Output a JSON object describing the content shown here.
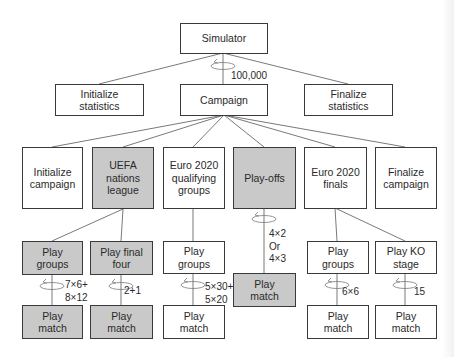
{
  "colors": {
    "border": "#3a3a3a",
    "shaded_fill": "#c9c9c9",
    "plain_fill": "#ffffff",
    "line": "#6a6a6a"
  },
  "tier1": {
    "simulator": "Simulator",
    "loop_label": "100,000"
  },
  "tier2": {
    "initialize_statistics": "Initialize\nstatistics",
    "campaign": "Campaign",
    "finalize_statistics": "Finalize\nstatistics"
  },
  "tier3": {
    "initialize_campaign": "Initialize\ncampaign",
    "uefa_nations_league": "UEFA\nnations\nleague",
    "euro_qualifying_groups": "Euro 2020\nqualifying\ngroups",
    "play_offs": "Play-offs",
    "euro_finals": "Euro 2020\nfinals",
    "finalize_campaign": "Finalize\ncampaign"
  },
  "tier4": {
    "nl_play_groups": "Play\ngroups",
    "nl_play_final_four": "Play final\nfour",
    "q_play_groups": "Play\ngroups",
    "f_play_groups": "Play\ngroups",
    "f_play_ko_stage": "Play KO\nstage"
  },
  "tier5": {
    "nl_groups_match": "Play\nmatch",
    "nl_final_four_match": "Play\nmatch",
    "q_match": "Play\nmatch",
    "playoffs_match": "Play\nmatch",
    "f_groups_match": "Play\nmatch",
    "f_ko_match": "Play\nmatch"
  },
  "loop_labels": {
    "nl_groups": "7×6+\n8×12",
    "nl_final_four": "2+1",
    "q_groups": "5×30+\n5×20",
    "playoffs": "4×2\nOr\n4×3",
    "f_groups": "6×6",
    "f_ko": "15"
  },
  "shaded_nodes": [
    "UEFA nations league",
    "Play-offs",
    "Play groups (nations league)",
    "Play final four",
    "Play match (nations league x2)",
    "Play match (play-offs)"
  ]
}
